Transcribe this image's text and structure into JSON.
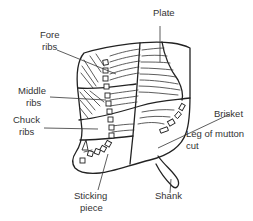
{
  "diagram": {
    "line_color": "#222222",
    "background": "#ffffff",
    "labels": {
      "plate": "Plate",
      "fore_ribs_1": "Fore",
      "fore_ribs_2": "ribs",
      "middle_ribs_1": "Middle",
      "middle_ribs_2": "ribs",
      "chuck_ribs_1": "Chuck",
      "chuck_ribs_2": "ribs",
      "brisket": "Brisket",
      "leg_of_mutton_1": "Leg of mutton",
      "leg_of_mutton_2": "cut",
      "sticking_piece_1": "Sticking",
      "sticking_piece_2": "piece",
      "shank": "Shank"
    }
  }
}
